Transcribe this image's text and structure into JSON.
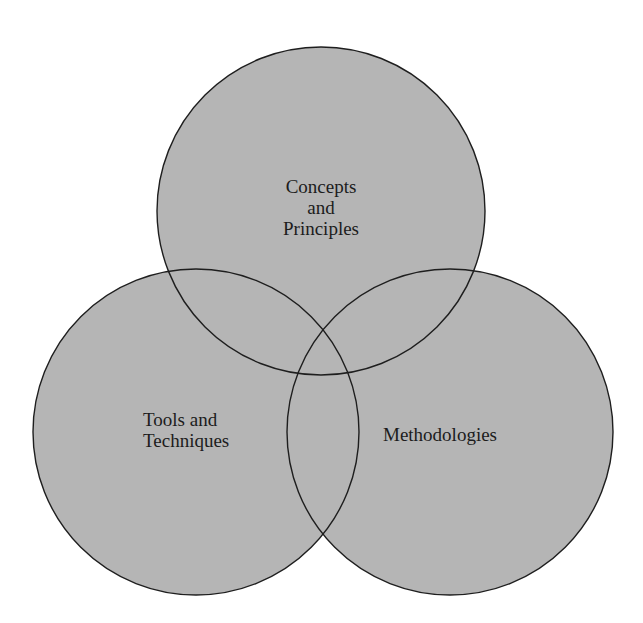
{
  "diagram": {
    "type": "venn",
    "background": "#ffffff",
    "fill_color": "#b5b5b5",
    "stroke_color": "#1e1e1e",
    "circles": [
      {
        "id": "concepts",
        "cx": 321,
        "cy": 211,
        "r": 164,
        "label_lines": [
          "Concepts",
          "and",
          "Principles"
        ]
      },
      {
        "id": "tools",
        "cx": 196,
        "cy": 432,
        "r": 163,
        "label_lines": [
          "Tools and",
          "Techniques"
        ]
      },
      {
        "id": "methods",
        "cx": 450,
        "cy": 432,
        "r": 163,
        "label_lines": [
          "Methodologies"
        ]
      }
    ]
  }
}
